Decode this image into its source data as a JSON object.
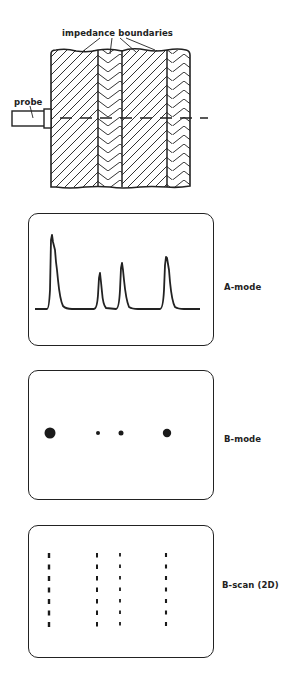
{
  "figure": {
    "top_diagram": {
      "label_boundaries": "impedance boundaries",
      "label_probe": "probe",
      "layers": [
        {
          "x0": 51,
          "x1": 98,
          "hatch": "forward"
        },
        {
          "x0": 98,
          "x1": 122,
          "hatch": "chevron"
        },
        {
          "x0": 122,
          "x1": 167,
          "hatch": "forward"
        },
        {
          "x0": 167,
          "x1": 190,
          "hatch": "chevron"
        }
      ],
      "boundary_x": [
        98,
        122,
        167
      ]
    },
    "a_mode": {
      "label": "A-mode",
      "baseline_y": 309,
      "peaks": [
        {
          "x": 52,
          "top_y": 235
        },
        {
          "x": 100,
          "top_y": 273
        },
        {
          "x": 122,
          "top_y": 263
        },
        {
          "x": 167,
          "top_y": 257
        }
      ]
    },
    "b_mode": {
      "label": "B-mode",
      "dots": [
        {
          "x": 50,
          "y": 433,
          "r": 5.5
        },
        {
          "x": 98,
          "y": 433,
          "r": 2
        },
        {
          "x": 121,
          "y": 433,
          "r": 2.5
        },
        {
          "x": 167,
          "y": 433,
          "r": 4.2
        }
      ]
    },
    "b_scan": {
      "label": "B-scan (2D)",
      "columns_x": [
        49,
        97,
        120,
        166
      ],
      "y_start": 553,
      "y_end": 629
    }
  }
}
